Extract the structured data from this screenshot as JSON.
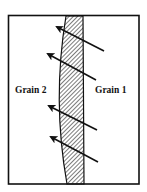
{
  "diagram": {
    "labels": {
      "left": "Grain 2",
      "right": "Grain 1"
    },
    "colors": {
      "line": "#111111",
      "background": "#ffffff"
    },
    "arrows": [
      {
        "from": [
          104,
          51
        ],
        "to": [
          57,
          27
        ]
      },
      {
        "from": [
          96,
          80
        ],
        "to": [
          48,
          54
        ]
      },
      {
        "from": [
          97,
          130
        ],
        "to": [
          49,
          106
        ]
      },
      {
        "from": [
          98,
          162
        ],
        "to": [
          51,
          137
        ]
      }
    ]
  }
}
